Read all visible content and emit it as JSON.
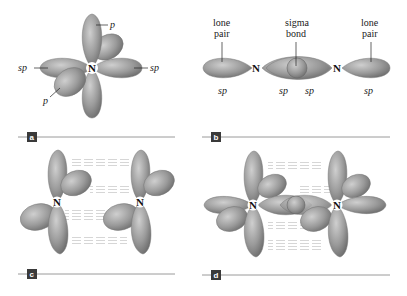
{
  "figure": {
    "colors": {
      "lobe": "#8c8c8c",
      "lobe_light": "#c4c4c4",
      "line": "#9a9a9a",
      "tag_bg": "#3a3a3a",
      "dash": "#d8d8d8"
    }
  },
  "panels": [
    {
      "id": "a",
      "tag": "a",
      "atom": "N",
      "labels": {
        "p_top": "p",
        "p_bottom": "p",
        "sp_left": "sp",
        "sp_right": "sp"
      }
    },
    {
      "id": "b",
      "tag": "b",
      "atoms": [
        "N",
        "N"
      ],
      "labels": {
        "lone_pair_left_1": "lone",
        "lone_pair_left_2": "pair",
        "sigma_1": "sigma",
        "sigma_2": "bond",
        "lone_pair_right_1": "lone",
        "lone_pair_right_2": "pair",
        "sp": [
          "sp",
          "sp",
          "sp",
          "sp"
        ]
      }
    },
    {
      "id": "c",
      "tag": "c",
      "atoms": [
        "N",
        "N"
      ]
    },
    {
      "id": "d",
      "tag": "d",
      "atoms": [
        "N",
        "N"
      ]
    }
  ]
}
